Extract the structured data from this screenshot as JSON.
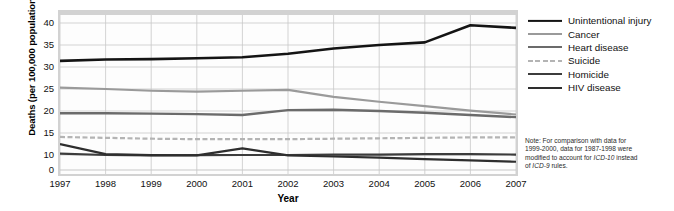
{
  "chart_data": {
    "type": "line",
    "title": "",
    "xlabel": "Year",
    "ylabel": "Deaths (per 100,000 population)",
    "x": [
      1997,
      1998,
      1999,
      2000,
      2001,
      2002,
      2003,
      2004,
      2005,
      2006,
      2007
    ],
    "xtick_labels": [
      "1997",
      "1998",
      "1999",
      "2000",
      "2001",
      "2002",
      "2003",
      "2004",
      "2005",
      "2006",
      "2007"
    ],
    "ytick_labels": [
      "0",
      "10",
      "15",
      "20",
      "25",
      "30",
      "35",
      "40"
    ],
    "ytick_values": [
      0,
      10,
      15,
      20,
      25,
      30,
      35,
      40
    ],
    "ylim": [
      0,
      41
    ],
    "y_axis_broken": true,
    "y_axis_break_note": "axis compressed between 0 and 10 (no tick at 5)",
    "grid": true,
    "legend_position": "right",
    "series": [
      {
        "name": "Unintentional injury",
        "color": "#141414",
        "width": 2.6,
        "dash": "solid",
        "values": [
          31.4,
          31.7,
          31.8,
          32.0,
          32.2,
          33.0,
          34.2,
          35.0,
          35.6,
          39.5,
          38.9
        ]
      },
      {
        "name": "Cancer",
        "color": "#9a9a9a",
        "width": 2.2,
        "dash": "solid",
        "values": [
          25.3,
          25.0,
          24.6,
          24.4,
          24.6,
          24.8,
          23.2,
          22.1,
          21.1,
          20.1,
          19.2
        ]
      },
      {
        "name": "Heart disease",
        "color": "#6b6b6b",
        "width": 2.4,
        "dash": "solid",
        "values": [
          19.5,
          19.5,
          19.4,
          19.3,
          19.1,
          20.2,
          20.3,
          20.0,
          19.6,
          19.1,
          18.6
        ]
      },
      {
        "name": "Suicide",
        "color": "#b4b4b4",
        "width": 2.2,
        "dash": "dashed",
        "values": [
          14.1,
          13.9,
          13.7,
          13.6,
          13.6,
          13.6,
          13.7,
          13.8,
          13.9,
          14.0,
          14.0
        ]
      },
      {
        "name": "Homicide",
        "color": "#3c3c3c",
        "width": 2.2,
        "dash": "solid",
        "values": [
          10.3,
          10.0,
          9.8,
          9.9,
          10.0,
          10.0,
          10.1,
          10.1,
          10.2,
          10.2,
          10.1
        ]
      },
      {
        "name": "HIV disease",
        "color": "#2e2e2e",
        "width": 2.2,
        "dash": "solid",
        "values": [
          12.5,
          10.2,
          9.9,
          9.8,
          11.5,
          9.8,
          9.0,
          8.2,
          7.3,
          6.4,
          5.5
        ]
      }
    ]
  },
  "note": {
    "line1": "Note: For comparison with data for",
    "line2_pre": "1999-2000, data for 1987-1998 were",
    "line3_pre": "modified to account for ",
    "line3_italic": "ICD-10",
    "line3_post": " instead",
    "line4_pre": "of ",
    "line4_italic": "ICD-9",
    "line4_post": " rules."
  }
}
